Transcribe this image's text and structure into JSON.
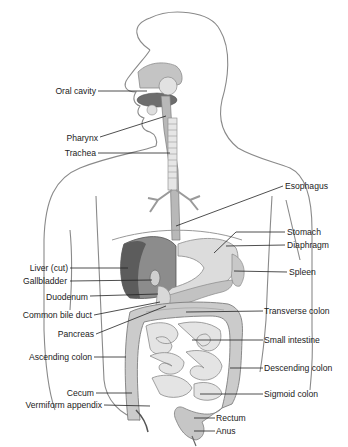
{
  "figure": {
    "colors": {
      "outline": "#8a8a8a",
      "organ_light": "#d6d6d6",
      "organ_mid": "#bdbdbd",
      "liver_dark": "#5c5c5c",
      "liver_mid": "#8c8c8c",
      "tongue": "#6d6d6d",
      "line": "#222222"
    }
  },
  "labels_left": [
    {
      "id": "oral-cavity",
      "text": "Oral cavity"
    },
    {
      "id": "pharynx",
      "text": "Pharynx"
    },
    {
      "id": "trachea",
      "text": "Trachea"
    },
    {
      "id": "liver",
      "text": "Liver (cut)"
    },
    {
      "id": "gallbladder",
      "text": "Gallbladder"
    },
    {
      "id": "duodenum",
      "text": "Duodenum"
    },
    {
      "id": "common-bile-duct",
      "text": "Common bile duct"
    },
    {
      "id": "pancreas",
      "text": "Pancreas"
    },
    {
      "id": "ascending-colon",
      "text": "Ascending colon"
    },
    {
      "id": "cecum",
      "text": "Cecum"
    },
    {
      "id": "vermiform-appendix",
      "text": "Vermiform appendix"
    }
  ],
  "labels_right": [
    {
      "id": "esophagus",
      "text": "Esophagus"
    },
    {
      "id": "stomach",
      "text": "Stomach"
    },
    {
      "id": "diaphragm",
      "text": "Diaphragm"
    },
    {
      "id": "spleen",
      "text": "Spleen"
    },
    {
      "id": "transverse-colon",
      "text": "Transverse colon"
    },
    {
      "id": "small-intestine",
      "text": "Small intestine"
    },
    {
      "id": "descending-colon",
      "text": "Descending colon"
    },
    {
      "id": "sigmoid-colon",
      "text": "Sigmoid colon"
    },
    {
      "id": "rectum",
      "text": "Rectum"
    },
    {
      "id": "anus",
      "text": "Anus"
    }
  ]
}
